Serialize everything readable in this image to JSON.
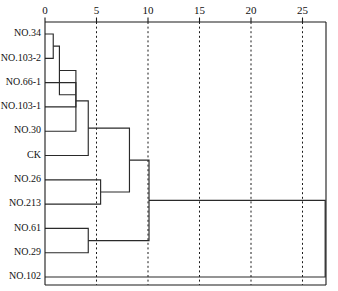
{
  "chart_data": {
    "type": "dendrogram",
    "title": "",
    "xlabel": "",
    "ylabel": "",
    "orientation": "horizontal",
    "xlim": [
      0,
      26.5
    ],
    "grid": true,
    "grid_axis": "x",
    "axis_position": "top",
    "tick_values": [
      0,
      5,
      10,
      15,
      20,
      25
    ],
    "tick_labels": [
      "0",
      "5",
      "10",
      "15",
      "20",
      "25"
    ],
    "leaves": [
      "NO.34",
      "NO.103-2",
      "NO.66-1",
      "NO.103-1",
      "NO.30",
      "CK",
      "NO.26",
      "NO.213",
      "NO.61",
      "NO.29",
      "NO.102"
    ],
    "merges": [
      {
        "id": "m1",
        "left": "NO.34",
        "right": "NO.103-2",
        "height": 0.8
      },
      {
        "id": "m2",
        "left": "NO.66-1",
        "right": "NO.103-1",
        "height": 3.0
      },
      {
        "id": "m3",
        "left": "m1",
        "right": "m2",
        "height": 1.4
      },
      {
        "id": "m4",
        "left": "m3",
        "right": "NO.30",
        "height": 3.0
      },
      {
        "id": "m5",
        "left": "m4",
        "right": "CK",
        "height": 4.2
      },
      {
        "id": "m6",
        "left": "NO.26",
        "right": "NO.213",
        "height": 5.4
      },
      {
        "id": "m7",
        "left": "NO.61",
        "right": "NO.29",
        "height": 4.2
      },
      {
        "id": "m8",
        "left": "m5",
        "right": "m6",
        "height": 8.2
      },
      {
        "id": "m9",
        "left": "m8",
        "right": "m7",
        "height": 10.1
      },
      {
        "id": "m10",
        "left": "m9",
        "right": "NO.102",
        "height": 27.2
      }
    ],
    "colors": {
      "link": "#2a2a2a",
      "axis": "#1a1a1a",
      "grid": "#1a1a1a",
      "background": "#ffffff",
      "text": "#111111"
    }
  },
  "layout": {
    "plot_left": 45,
    "plot_right": 326,
    "plot_top": 22,
    "plot_bottom": 285,
    "leaf_first_y": 34,
    "leaf_step": 24.3,
    "px_per_unit": 10.3
  }
}
